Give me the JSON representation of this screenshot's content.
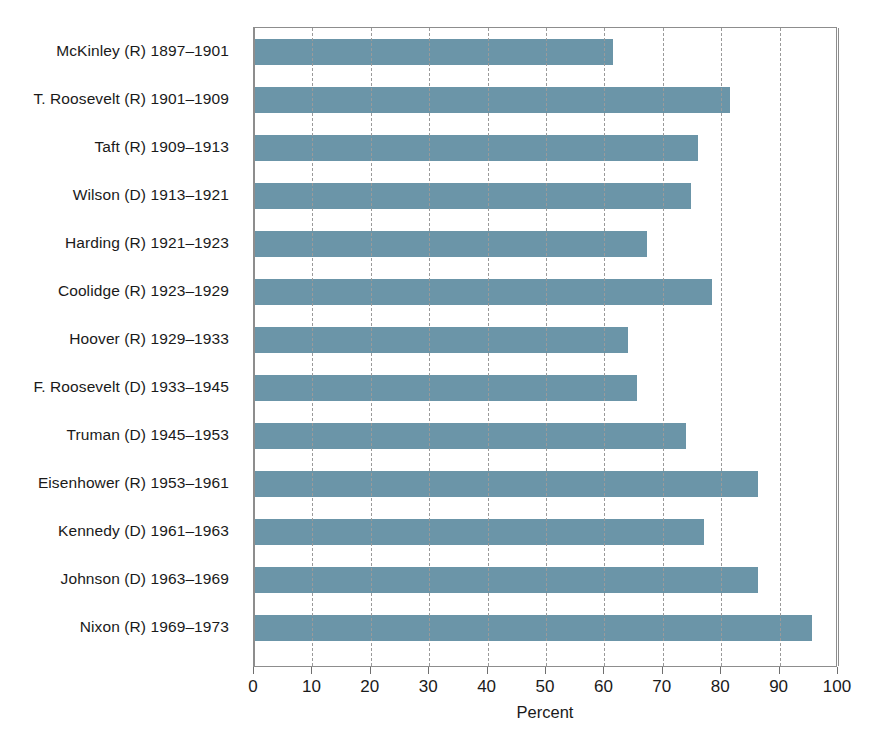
{
  "chart_data": {
    "type": "bar",
    "orientation": "horizontal",
    "title": "",
    "xlabel": "Percent",
    "ylabel": "",
    "xlim": [
      0,
      100
    ],
    "xticks": [
      0,
      10,
      20,
      30,
      40,
      50,
      60,
      70,
      80,
      90,
      100
    ],
    "grid": true,
    "legend": "none",
    "bar_color": "#6b95a8",
    "categories": [
      "McKinley (R) 1897–1901",
      "T. Roosevelt (R) 1901–1909",
      "Taft (R) 1909–1913",
      "Wilson (D) 1913–1921",
      "Harding (R) 1921–1923",
      "Coolidge (R) 1923–1929",
      "Hoover (R) 1929–1933",
      "F. Roosevelt (D) 1933–1945",
      "Truman (D) 1945–1953",
      "Eisenhower (R) 1953–1961",
      "Kennedy (D) 1961–1963",
      "Johnson (D) 1963–1969",
      "Nixon (R) 1969–1973"
    ],
    "values": [
      61.5,
      81.5,
      76,
      74.8,
      67.3,
      78.5,
      64,
      65.5,
      74,
      86.3,
      77,
      86.3,
      95.5
    ]
  }
}
